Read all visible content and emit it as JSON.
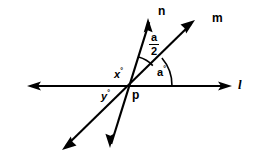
{
  "figure": {
    "type": "geometry-diagram",
    "background_color": "#ffffff",
    "stroke_color": "#000000"
  },
  "vertex": {
    "label": "p",
    "x": 130,
    "y": 86
  },
  "lines": [
    {
      "name": "l",
      "label": "l",
      "kind": "horizontal-line",
      "x1": 27,
      "y1": 86,
      "x2": 232,
      "y2": 86,
      "arrow_start": true,
      "arrow_end": true
    },
    {
      "name": "m",
      "label": "m",
      "kind": "diagonal-line",
      "x1": 195,
      "y1": 20,
      "x2": 62,
      "y2": 150,
      "arrow_start": true,
      "arrow_end": true
    },
    {
      "name": "n",
      "label": "n",
      "kind": "diagonal-line",
      "x1": 148,
      "y1": 18,
      "x2": 110,
      "y2": 148,
      "arrow_start": true,
      "arrow_end": true
    }
  ],
  "angle_labels": [
    {
      "name": "angle-a-half",
      "text": "a",
      "denominator": "2",
      "style": "fraction",
      "meaning": "angle between ray n and ray m"
    },
    {
      "name": "angle-a",
      "text": "a",
      "unit": "°",
      "meaning": "angle between ray m and line l to the right"
    },
    {
      "name": "angle-x",
      "text": "x",
      "unit": "°",
      "meaning": "angle above line l on the left of ray n"
    },
    {
      "name": "angle-y",
      "text": "y",
      "unit": "°",
      "meaning": "angle below line l on the left"
    }
  ],
  "labels": {
    "ray_n": "n",
    "ray_m": "m",
    "line_l": "l",
    "vertex_p": "p",
    "angle_x": "x",
    "angle_y": "y",
    "angle_a": "a",
    "fraction_numerator": "a",
    "fraction_denominator": "2",
    "degree_symbol": "°"
  },
  "arcs": [
    {
      "name": "arc-a-half",
      "radius": 30,
      "between": [
        "n",
        "m"
      ]
    },
    {
      "name": "arc-a",
      "radius": 42,
      "between": [
        "m",
        "l"
      ]
    }
  ]
}
